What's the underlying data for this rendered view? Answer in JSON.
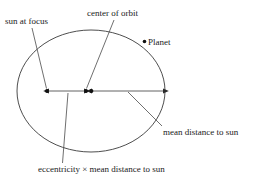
{
  "figure": {
    "stroke_color": "#3a3a3a",
    "text_color": "#1a1a1a",
    "background_color": "#ffffff"
  },
  "labels": {
    "sun_at_focus": "sun at focus",
    "center_of_orbit": "center of orbit",
    "planet": "Planet",
    "mean_distance_to_sun": "mean distance to sun",
    "eccentricity_times_mean_distance": "eccentricity × mean distance to sun"
  },
  "geometry": {
    "orbit": {
      "center_x": 91,
      "center_y": 91,
      "radius_x": 74,
      "radius_y": 61
    },
    "markers": {
      "sun_focus_x": 47,
      "sun_focus_y": 91,
      "orbit_center_x": 86,
      "orbit_center_y": 91,
      "second_focus_x": 91,
      "second_focus_y": 91,
      "planet_x": 144,
      "planet_y": 41
    },
    "measure_lines": {
      "eccentricity_segment": {
        "x1": 47,
        "x2": 86,
        "y": 91
      },
      "mean_distance_segment": {
        "x1": 91,
        "x2": 164,
        "y": 91
      }
    }
  }
}
